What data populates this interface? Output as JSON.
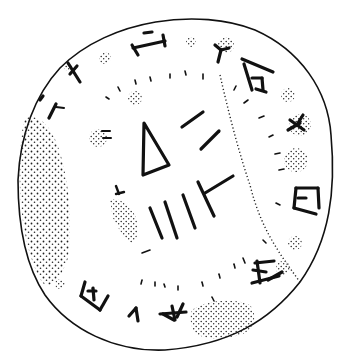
{
  "figure": {
    "ink_color": "#111111",
    "background_color": "#ffffff",
    "stipple_color": "#222222"
  },
  "disc": {
    "outline": "irregular roughly circular outline"
  },
  "signs": {
    "outer_ring": [
      "I-sign",
      "X-sign",
      "two-strokes",
      "Y-sign",
      "comb-sign",
      "Y-with-bar",
      "H-sign",
      "box-sign",
      "box-sign-lower",
      "A-sign",
      "V-sign",
      "box-sign-left"
    ],
    "inner": [
      "triangle",
      "double-stroke",
      "four-strokes",
      "T-sign"
    ]
  },
  "damage_areas": [
    "left-edge",
    "lower-right",
    "upper-right-cluster",
    "middle-left"
  ]
}
